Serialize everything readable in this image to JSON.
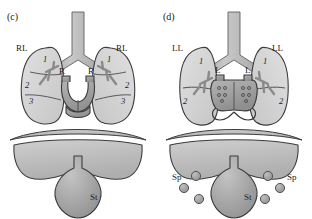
{
  "figure": {
    "type": "anatomical-diagram"
  },
  "panels": [
    {
      "id": "c",
      "caption": "(c)",
      "x_offset": 0,
      "lungs": [
        {
          "side": "left-of-image",
          "label": "RL",
          "lobes": [
            "1",
            "2",
            "3"
          ]
        },
        {
          "side": "right-of-image",
          "label": "RL",
          "lobes": [
            "1",
            "2",
            "3"
          ]
        }
      ],
      "atria": [
        {
          "side": "left-of-image",
          "label": "R"
        },
        {
          "side": "right-of-image",
          "label": "R"
        }
      ],
      "abdomen": {
        "stomach_label": "St",
        "spleen_label": null,
        "spleens": []
      }
    },
    {
      "id": "d",
      "caption": "(d)",
      "x_offset": 156,
      "lungs": [
        {
          "side": "left-of-image",
          "label": "LL",
          "lobes": [
            "1",
            "2"
          ]
        },
        {
          "side": "right-of-image",
          "label": "LL",
          "lobes": [
            "1",
            "2"
          ]
        }
      ],
      "atria": [
        {
          "side": "left-of-image",
          "label": "L"
        },
        {
          "side": "right-of-image",
          "label": "L"
        }
      ],
      "abdomen": {
        "stomach_label": "St",
        "spleen_label_left": "Sp",
        "spleen_label_right": "Sp",
        "spleens": [
          {
            "cx": 196,
            "cy": 176,
            "r": 4.6
          },
          {
            "cx": 184,
            "cy": 188,
            "r": 4.6
          },
          {
            "cx": 199,
            "cy": 199,
            "r": 4.6
          },
          {
            "cx": 268,
            "cy": 176,
            "r": 4.6
          },
          {
            "cx": 280,
            "cy": 188,
            "r": 4.6
          },
          {
            "cx": 265,
            "cy": 199,
            "r": 4.6
          }
        ]
      }
    }
  ],
  "colors": {
    "lung_fill": "#d2d2d2",
    "airway_fill": "#b4b4b4",
    "heart_fill": "#a6a6a6",
    "diaphragm_fill": "#b8b8b8",
    "liver_fill": "#bcbcbc",
    "stomach_fill": "#a8a8a8",
    "spleen_fill": "#a0a0a0",
    "outline": "#3c3c3c",
    "text": "#222222",
    "background": "#ffffff"
  }
}
